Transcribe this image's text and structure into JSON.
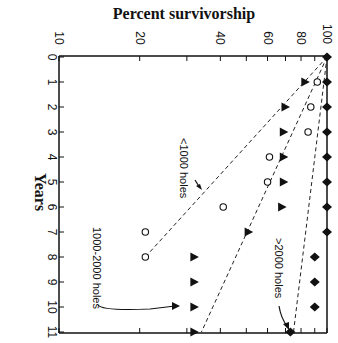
{
  "chart_data": {
    "type": "scatter",
    "orientation": "rotated-90",
    "title": "Percent survivorship",
    "xlabel": "Years",
    "ylabel": "Percent survivorship",
    "y_scale": "log",
    "ylim": [
      10,
      100
    ],
    "xlim": [
      0,
      11
    ],
    "y_ticks": [
      10,
      20,
      40,
      60,
      80,
      100
    ],
    "x_ticks": [
      0,
      1,
      2,
      3,
      4,
      5,
      6,
      7,
      8,
      9,
      10,
      11
    ],
    "grid": false,
    "series": [
      {
        "name": "<1000 holes",
        "marker": "open-circle",
        "x": [
          0,
          1,
          2,
          3,
          4,
          5,
          6,
          7,
          8
        ],
        "values": [
          100,
          92,
          87,
          85,
          61,
          60,
          41,
          21,
          21
        ],
        "fit_line": {
          "x": [
            0,
            8
          ],
          "y": [
            100,
            21
          ]
        }
      },
      {
        "name": "1000-2000 holes",
        "marker": "filled-triangle",
        "x": [
          0,
          1,
          2,
          3,
          4,
          5,
          6,
          7,
          8,
          9,
          10,
          11
        ],
        "values": [
          100,
          83,
          70,
          69,
          69,
          69,
          68,
          51,
          32,
          32,
          32,
          32
        ],
        "fit_line": {
          "x": [
            0,
            11
          ],
          "y": [
            100,
            34
          ]
        }
      },
      {
        "name": ">2000 holes",
        "marker": "filled-diamond",
        "x": [
          0,
          1,
          2,
          3,
          4,
          5,
          6,
          7,
          8,
          9,
          10,
          11
        ],
        "values": [
          100,
          100,
          100,
          100,
          100,
          100,
          100,
          100,
          90,
          90,
          90,
          73
        ],
        "fit_line": {
          "x": [
            0,
            11
          ],
          "y": [
            100,
            75
          ]
        }
      }
    ],
    "annotations": [
      {
        "text": "<1000 holes",
        "points_to_series": "<1000 holes"
      },
      {
        "text": "1000-2000 holes",
        "points_to_series": "1000-2000 holes"
      },
      {
        "text": ">2000 holes",
        "points_to_series": ">2000 holes"
      }
    ]
  },
  "labels": {
    "title": "Percent survivorship",
    "xlabel": "Years",
    "y_tick_labels": [
      "10",
      "20",
      "40",
      "60",
      "80",
      "100"
    ],
    "x_tick_labels": [
      "0",
      "1",
      "2",
      "3",
      "4",
      "5",
      "6",
      "7",
      "8",
      "9",
      "10",
      "11"
    ],
    "annot_lt1000": "<1000 holes",
    "annot_mid": "1000-2000 holes",
    "annot_gt2000": ">2000 holes"
  }
}
